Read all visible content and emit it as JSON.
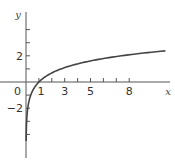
{
  "chart_data": {
    "type": "line",
    "title": "",
    "function": "y = ln x",
    "xlabel": "x",
    "ylabel": "y",
    "origin_label": "0",
    "x_ticks": [
      1,
      2,
      3,
      4,
      5,
      6,
      7,
      8
    ],
    "x_tick_labels": [
      "1",
      "3",
      "5",
      "8"
    ],
    "y_ticks": [
      -4,
      -3,
      -2,
      -1,
      1,
      2,
      3,
      4
    ],
    "y_tick_labels": [
      "2",
      "-2"
    ],
    "xlim": [
      0,
      11
    ],
    "ylim": [
      -5,
      5
    ],
    "grid": false,
    "series": [
      {
        "name": "y = ln x",
        "x": [
          0.011,
          0.02,
          0.05,
          0.1,
          0.2,
          0.3,
          0.5,
          0.7,
          1,
          1.5,
          2,
          3,
          4,
          5,
          6,
          7,
          8,
          9,
          10,
          10.8
        ],
        "y": [
          -4.5,
          -3.91,
          -3.0,
          -2.3,
          -1.61,
          -1.2,
          -0.69,
          -0.36,
          0,
          0.41,
          0.69,
          1.1,
          1.39,
          1.61,
          1.79,
          1.95,
          2.08,
          2.2,
          2.3,
          2.38
        ]
      }
    ],
    "colors": {
      "axis": "#555555",
      "curve": "#444444"
    }
  }
}
